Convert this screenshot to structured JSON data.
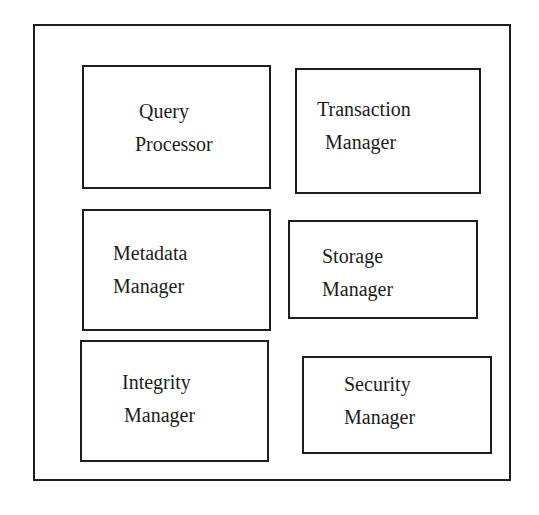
{
  "diagram": {
    "type": "component-block-diagram",
    "colors": {
      "background": "#ffffff",
      "stroke": "#1e1e1e",
      "text": "#1c1c1c"
    },
    "components": [
      {
        "id": "query-processor",
        "lines": [
          "Query",
          "Processor"
        ],
        "box": {
          "left": 82,
          "top": 65,
          "width": 189,
          "height": 124
        },
        "text": {
          "left": 55,
          "top": 28,
          "lines_offset": [
            0,
            -4
          ]
        }
      },
      {
        "id": "transaction-manager",
        "lines": [
          "Transaction",
          "Manager"
        ],
        "box": {
          "left": 295,
          "top": 68,
          "width": 186,
          "height": 126
        },
        "text": {
          "left": 20,
          "top": 23,
          "lines_offset": [
            0,
            8
          ]
        }
      },
      {
        "id": "metadata-manager",
        "lines": [
          "Metadata",
          "Manager"
        ],
        "box": {
          "left": 82,
          "top": 209,
          "width": 189,
          "height": 122
        },
        "text": {
          "left": 29,
          "top": 26,
          "lines_offset": [
            0,
            0
          ]
        }
      },
      {
        "id": "storage-manager",
        "lines": [
          "Storage",
          "Manager"
        ],
        "box": {
          "left": 288,
          "top": 220,
          "width": 190,
          "height": 99
        },
        "text": {
          "left": 32,
          "top": 18,
          "lines_offset": [
            0,
            0
          ]
        }
      },
      {
        "id": "integrity-manager",
        "lines": [
          "Integrity",
          "Manager"
        ],
        "box": {
          "left": 80,
          "top": 340,
          "width": 189,
          "height": 122
        },
        "text": {
          "left": 40,
          "top": 24,
          "lines_offset": [
            0,
            2
          ]
        }
      },
      {
        "id": "security-manager",
        "lines": [
          "Security",
          "Manager"
        ],
        "box": {
          "left": 302,
          "top": 356,
          "width": 190,
          "height": 98
        },
        "text": {
          "left": 40,
          "top": 10,
          "lines_offset": [
            0,
            0
          ]
        }
      }
    ]
  }
}
